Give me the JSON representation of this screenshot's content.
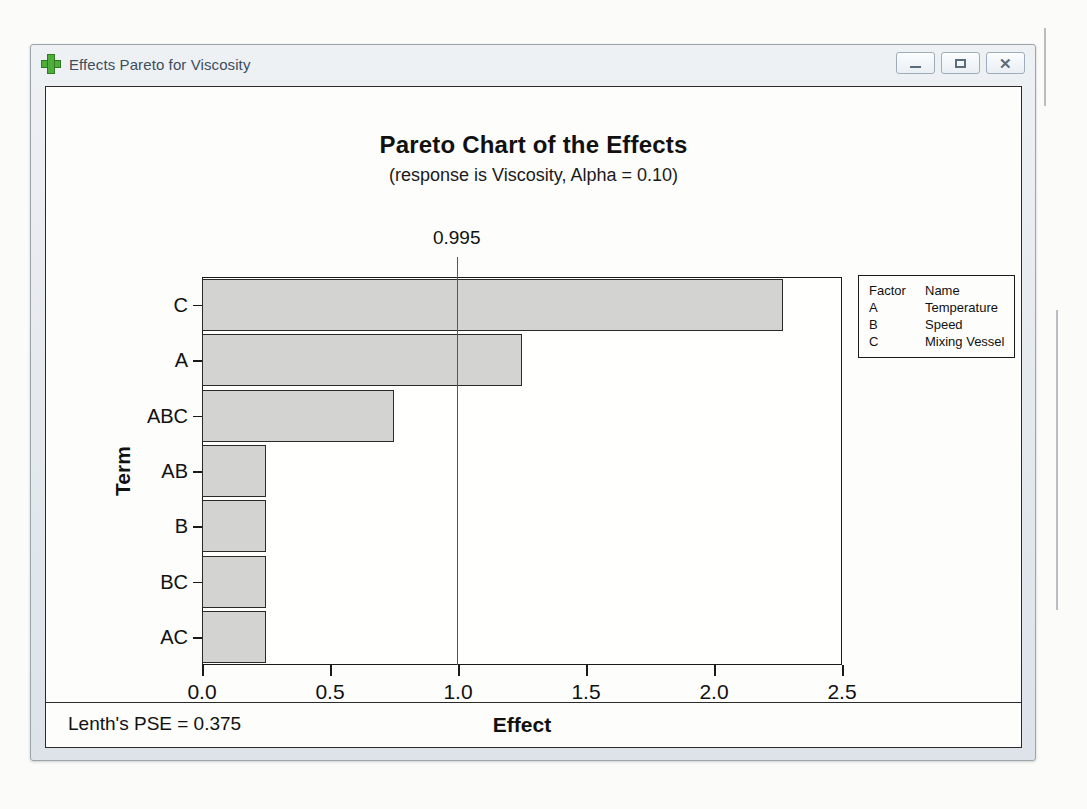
{
  "window": {
    "title": "Effects Pareto for Viscosity",
    "icon": "green-plus-icon",
    "controls": {
      "minimize_label": "",
      "maximize_label": "",
      "close_label": "✕"
    }
  },
  "chart_data": {
    "type": "bar",
    "orientation": "horizontal",
    "title": "Pareto Chart of the Effects",
    "subtitle": "(response is Viscosity, Alpha = 0.10)",
    "xlabel": "Effect",
    "ylabel": "Term",
    "categories": [
      "C",
      "A",
      "ABC",
      "AB",
      "B",
      "BC",
      "AC"
    ],
    "values": [
      2.27,
      1.25,
      0.75,
      0.25,
      0.25,
      0.25,
      0.25
    ],
    "xlim": [
      0.0,
      2.5
    ],
    "xticks": [
      0.0,
      0.5,
      1.0,
      1.5,
      2.0,
      2.5
    ],
    "xtick_labels": [
      "0.0",
      "0.5",
      "1.0",
      "1.5",
      "2.0",
      "2.5"
    ],
    "grid": false,
    "bar_fill_color": "#d3d3d1",
    "bar_edge_color": "#2a2a2a",
    "reference_line": {
      "value": 0.995,
      "label": "0.995",
      "color": "#d62027"
    },
    "legend": {
      "position": "right-outside",
      "headers": [
        "Factor",
        "Name"
      ],
      "rows": [
        {
          "factor": "A",
          "name": "Temperature"
        },
        {
          "factor": "B",
          "name": "Speed"
        },
        {
          "factor": "C",
          "name": "Mixing Vessel"
        }
      ]
    },
    "annotations": [
      {
        "name": "lenths-pse",
        "text": "Lenth's PSE = 0.375"
      }
    ]
  },
  "footnote": "Lenth's PSE = 0.375"
}
